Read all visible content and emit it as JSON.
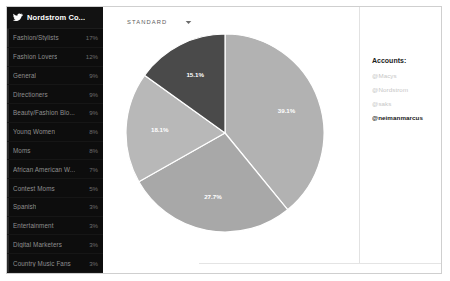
{
  "sidebar": {
    "icon": "twitter-bird-icon",
    "title": "Nordstrom Co...",
    "segments": [
      {
        "label": "Fashion/Stylists",
        "pct": "17%"
      },
      {
        "label": "Fashion Lovers",
        "pct": "12%"
      },
      {
        "label": "General",
        "pct": "9%"
      },
      {
        "label": "Directioners",
        "pct": "9%"
      },
      {
        "label": "Beauty/Fashion Blo...",
        "pct": "9%"
      },
      {
        "label": "Young Women",
        "pct": "8%"
      },
      {
        "label": "Moms",
        "pct": "8%"
      },
      {
        "label": "African American W...",
        "pct": "7%"
      },
      {
        "label": "Contest Moms",
        "pct": "5%"
      },
      {
        "label": "Spanish",
        "pct": "3%"
      },
      {
        "label": "Entertainment",
        "pct": "3%"
      },
      {
        "label": "Digital Marketers",
        "pct": "3%"
      },
      {
        "label": "Country Music Fans",
        "pct": "3%"
      }
    ]
  },
  "toolbar": {
    "view_label": "STANDARD",
    "caret": "chevron-down-icon"
  },
  "accounts_panel": {
    "title": "Accounts:",
    "items": [
      {
        "handle": "@Macys",
        "state": "dim"
      },
      {
        "handle": "@Nordstrom",
        "state": "dim"
      },
      {
        "handle": "@saks",
        "state": "dim"
      },
      {
        "handle": "@neimanmarcus",
        "state": "active"
      }
    ]
  },
  "colors": {
    "sidebar_bg": "#0d0d0d",
    "slice_light": "#b2b2b2",
    "slice_mid": "#a8a8a8",
    "slice_left": "#b8b8b8",
    "slice_dark": "#4a4a4a",
    "accent_active": "#161616"
  },
  "chart_data": {
    "type": "pie",
    "title": "",
    "legend": "none",
    "labels": [
      "39.1%",
      "27.7%",
      "18.1%",
      "15.1%"
    ],
    "values": [
      39.1,
      27.7,
      18.1,
      15.1
    ],
    "categories": [
      "@neimanmarcus",
      "@saks",
      "@Nordstrom",
      "@Macys"
    ],
    "slice_colors": [
      "#b2b2b2",
      "#a8a8a8",
      "#b8b8b8",
      "#4a4a4a"
    ],
    "start_angle_deg": 0,
    "direction": "clockwise",
    "data_labels": true,
    "units": "percent"
  }
}
